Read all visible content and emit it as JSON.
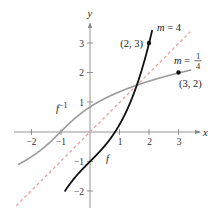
{
  "chart_data": {
    "type": "line",
    "title": "",
    "xlabel": "x",
    "ylabel": "y",
    "xlim": [
      -2.5,
      3.5
    ],
    "ylim": [
      -2.5,
      3.5
    ],
    "grid": false,
    "x_ticks": [
      "-2",
      "-1",
      "1",
      "2",
      "3"
    ],
    "y_ticks": [
      "3",
      "2",
      "1",
      "-1",
      "-2"
    ],
    "series": [
      {
        "name": "f",
        "label": "f",
        "style": "solid",
        "color": "#111111",
        "formula": "y = x^3/4 + x - 1",
        "x": [
          0.0,
          0.5,
          1.0,
          1.5,
          2.0
        ],
        "values": [
          -1.0,
          -0.47,
          0.25,
          1.34,
          3.0
        ]
      },
      {
        "name": "f_inverse",
        "label": "f⁻¹",
        "style": "solid",
        "color": "#999999",
        "x": [
          -1.0,
          -0.47,
          0.25,
          1.34,
          3.0
        ],
        "values": [
          0.0,
          0.5,
          1.0,
          1.5,
          2.0
        ]
      },
      {
        "name": "y_equals_x",
        "label": "y = x",
        "style": "dashed",
        "color": "#e8a0a0",
        "x": [
          -2.5,
          3.4
        ],
        "values": [
          -2.5,
          3.4
        ]
      }
    ],
    "annotations": [
      {
        "text": "(2, 3)",
        "point": [
          2,
          3
        ],
        "series": "f"
      },
      {
        "text": "m = 4",
        "series": "f",
        "meaning": "slope of tangent at (2, 3)"
      },
      {
        "text": "(3, 2)",
        "point": [
          3,
          2
        ],
        "series": "f_inverse"
      },
      {
        "text": "m = 1/4",
        "series": "f_inverse",
        "meaning": "slope of tangent at (3, 2)"
      }
    ]
  },
  "labels": {
    "x_axis": "x",
    "y_axis": "y",
    "f": "f",
    "f_inv_base": "f",
    "f_inv_sup": "−1",
    "point_23": "(2, 3)",
    "point_32": "(3, 2)",
    "m4_prefix": "m",
    "m4_eq": " = 4",
    "m14_prefix": "m",
    "m14_eq": " = ",
    "m14_num": "1",
    "m14_den": "4"
  },
  "ticks": {
    "x": {
      "n2": "−2",
      "n1": "−1",
      "p1": "1",
      "p2": "2",
      "p3": "3"
    },
    "y": {
      "p3": "3",
      "p2": "2",
      "p1": "1",
      "n1": "−1",
      "n2": "−2"
    }
  }
}
